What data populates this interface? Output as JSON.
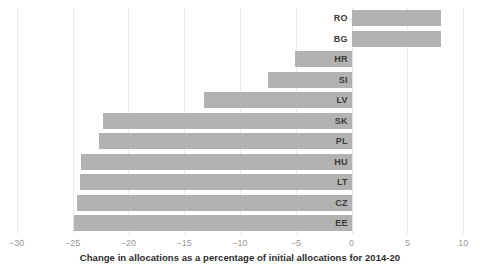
{
  "chart_data": {
    "type": "bar",
    "orientation": "horizontal",
    "title": "",
    "subtitle": "",
    "xlabel": "Change in allocations as a percentage of initial allocations for 2014-20",
    "ylabel": "",
    "categories": [
      "RO",
      "BG",
      "HR",
      "SI",
      "LV",
      "SK",
      "PL",
      "HU",
      "LT",
      "CZ",
      "EE"
    ],
    "values": [
      8.0,
      8.0,
      -5.1,
      -7.5,
      -13.2,
      -22.3,
      -22.6,
      -24.2,
      -24.3,
      -24.6,
      -24.9
    ],
    "series": [
      {
        "name": "Change in allocations",
        "values": [
          8.0,
          8.0,
          -5.1,
          -7.5,
          -13.2,
          -22.3,
          -22.6,
          -24.2,
          -24.3,
          -24.6,
          -24.9
        ]
      }
    ],
    "xlim": [
      -31.5,
      11.5
    ],
    "xticks": [
      -30,
      -25,
      -20,
      -15,
      -10,
      -5,
      0,
      5,
      10
    ],
    "xtick_labels": [
      "−30",
      "−25",
      "−20",
      "−15",
      "−10",
      "−5",
      "0",
      "5",
      "10"
    ],
    "grid": "vertical",
    "legend": "none",
    "bar_color": "#b2b2b2",
    "gridline_color": "#e9e9e9",
    "label_color": "#3b3b3b",
    "tick_color": "#9a9a9a",
    "background_color": "#ffffff"
  },
  "axis": {
    "title": "Change in allocations as a percentage of initial allocations for 2014-20"
  }
}
